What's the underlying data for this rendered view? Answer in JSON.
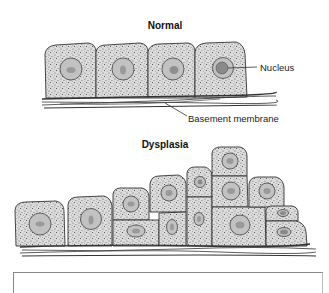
{
  "diagram": {
    "panels": [
      {
        "title": "Normal",
        "description": "Single orderly layer of uniform epithelial cells resting on basement membrane",
        "cell_count": 4,
        "labels": {
          "nucleus": "Nucleus",
          "basement_membrane": "Basement membrane"
        }
      },
      {
        "title": "Dysplasia",
        "description": "Disorganized, multilayered, variably sized cells with irregular nuclei on basement membrane"
      }
    ],
    "colors": {
      "cytoplasm_fill": "#d9d9d9",
      "cytoplasm_stipple": "#555555",
      "nucleus_fill": "#bdbdbd",
      "nucleolus_fill": "#8e8e8e",
      "outline": "#333333",
      "caption_border": "#888888"
    }
  }
}
